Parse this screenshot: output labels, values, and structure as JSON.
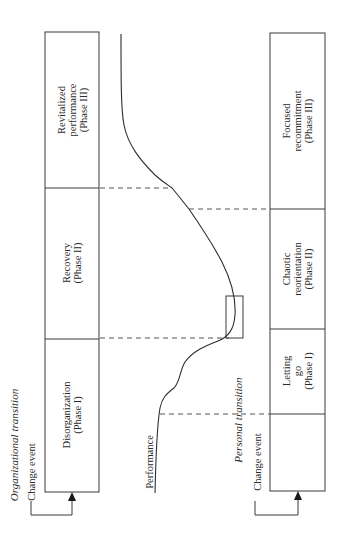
{
  "diagram": {
    "orientation": "rotated 90deg counter-clockwise",
    "organizational": {
      "title": "Organizational transition",
      "change_event": "Change event",
      "phases": [
        {
          "label": "Disorganization\n(Phase I)"
        },
        {
          "label": "Recovery\n(Phase II)"
        },
        {
          "label": "Revitalized\nperformance\n(Phase III)"
        }
      ]
    },
    "performance_label": "Performance",
    "personal": {
      "title": "Personal transition",
      "change_event": "Change event",
      "phases": [
        {
          "label": ""
        },
        {
          "label": "Letting\ngo\n(Phase I)"
        },
        {
          "label": "Chaotic\nreorientation\n(Phase II)"
        },
        {
          "label": "Focused\nrecommitment\n(Phase III)"
        }
      ]
    },
    "colors": {
      "line": "#3a3a3a",
      "dashed": "#555555",
      "background": "#ffffff"
    }
  }
}
